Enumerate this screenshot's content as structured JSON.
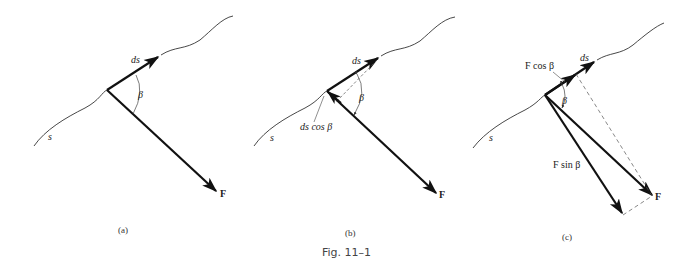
{
  "figure": {
    "caption": "Fig. 11–1",
    "panels": [
      {
        "id": "a",
        "label": "(a)",
        "path_label": "s",
        "ds_label": "ds",
        "angle_label": "β",
        "force_label": "F"
      },
      {
        "id": "b",
        "label": "(b)",
        "path_label": "s",
        "ds_label": "ds",
        "angle_label": "β",
        "force_label": "F",
        "projection_label": "ds cos β"
      },
      {
        "id": "c",
        "label": "(c)",
        "path_label": "s",
        "ds_label": "ds",
        "angle_label": "β",
        "force_label": "F",
        "tangential_label": "F cos β",
        "normal_label": "F sin β"
      }
    ]
  },
  "colors": {
    "line": "#111111",
    "curve": "#333333",
    "dashed": "#555555",
    "background": "#ffffff"
  }
}
